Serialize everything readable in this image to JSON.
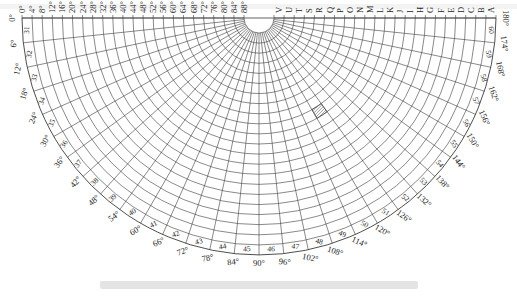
{
  "figure": {
    "type": "polar-sector-grid",
    "center": {
      "x": 259,
      "y": 18
    },
    "outer_radius": 237,
    "hub_radius": 15,
    "ring_count": 22,
    "sector_count": 30,
    "line_color": "#3a3a3a",
    "hatch_color": "#555555"
  },
  "left_labels": [
    "0°",
    "4°",
    "8°",
    "12°",
    "16°",
    "20°",
    "24°",
    "28°",
    "32°",
    "36°",
    "40°",
    "44°",
    "48°",
    "52°",
    "56°",
    "60°",
    "64°",
    "68°",
    "72°",
    "76°",
    "80°",
    "84°",
    "88°"
  ],
  "right_labels": [
    "V",
    "U",
    "T",
    "S",
    "R",
    "Q",
    "P",
    "O",
    "N",
    "M",
    "L",
    "K",
    "J",
    "I",
    "H",
    "G",
    "F",
    "E",
    "D",
    "C",
    "B",
    "A"
  ],
  "angle_labels": [
    "0°",
    "6°",
    "12°",
    "18°",
    "24°",
    "30°",
    "36°",
    "42°",
    "48°",
    "54°",
    "60°",
    "66°",
    "72°",
    "78°",
    "84°",
    "90°",
    "96°",
    "102°",
    "108°",
    "114°",
    "120°",
    "126°",
    "132°",
    "138°",
    "144°",
    "150°",
    "156°",
    "162°",
    "168°",
    "174°",
    "180°"
  ],
  "sector_numbers": [
    "31",
    "32",
    "33",
    "34",
    "35",
    "36",
    "37",
    "38",
    "39",
    "40",
    "41",
    "42",
    "43",
    "44",
    "45",
    "46",
    "47",
    "48",
    "49",
    "50",
    "51",
    "52",
    "53",
    "54",
    "55",
    "56",
    "57",
    "58",
    "59",
    "60"
  ],
  "highlighted_cell": {
    "sector_index": 20,
    "ring_index": 9,
    "description": "hatched cell"
  },
  "caption": {
    "text": null,
    "note": "faint gray caption line below the diagram, unreadable in the source"
  },
  "top_strip": {
    "text": null,
    "note": "faint text strip at the top edge, unreadable in the source"
  }
}
